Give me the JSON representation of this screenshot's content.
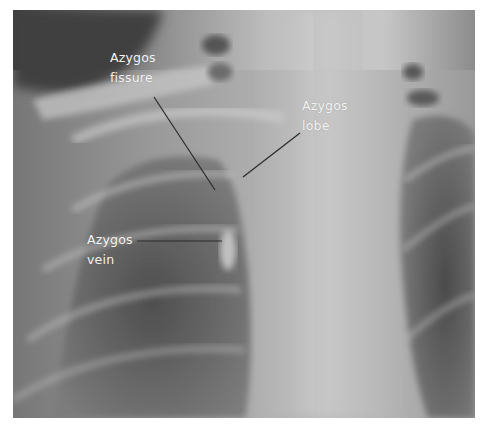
{
  "figure": {
    "annotations": [
      {
        "id": "azygos-fissure",
        "lines": [
          "Azygos",
          "fissure"
        ]
      },
      {
        "id": "azygos-lobe",
        "lines": [
          "Azygos",
          "lobe"
        ]
      },
      {
        "id": "azygos-vein",
        "lines": [
          "Azygos",
          "vein"
        ]
      }
    ],
    "colors": {
      "label_text": "#f4f4f4",
      "leader_line": "#2a2a2a",
      "background": "#ffffff"
    }
  }
}
